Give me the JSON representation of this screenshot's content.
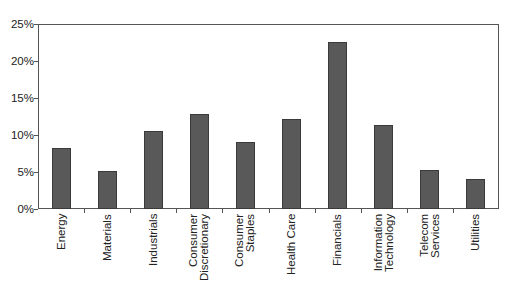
{
  "chart_data": {
    "type": "bar",
    "title": "",
    "xlabel": "",
    "ylabel": "",
    "categories": [
      "Energy",
      "Materials",
      "Industrials",
      "Consumer Discretionary",
      "Consumer Staples",
      "Health Care",
      "Financials",
      "Information Technology",
      "Telecom Services",
      "Utilities"
    ],
    "category_display": [
      "Energy",
      "Materials",
      "Industrials",
      "Consumer\nDiscretionary",
      "Consumer\nStaples",
      "Health Care",
      "Financials",
      "Information\nTechnology",
      "Telecom\nServices",
      "Utilities"
    ],
    "values": [
      8.2,
      5.1,
      10.6,
      12.9,
      9.0,
      12.1,
      22.6,
      11.4,
      5.3,
      4.1
    ],
    "value_unit": "%",
    "ylim": [
      0,
      25
    ],
    "yticks": [
      0,
      5,
      10,
      15,
      20,
      25
    ],
    "ytick_labels": [
      "0%",
      "5%",
      "10%",
      "15%",
      "20%",
      "25%"
    ],
    "grid": false,
    "legend": null,
    "bar_color": "#595959"
  }
}
